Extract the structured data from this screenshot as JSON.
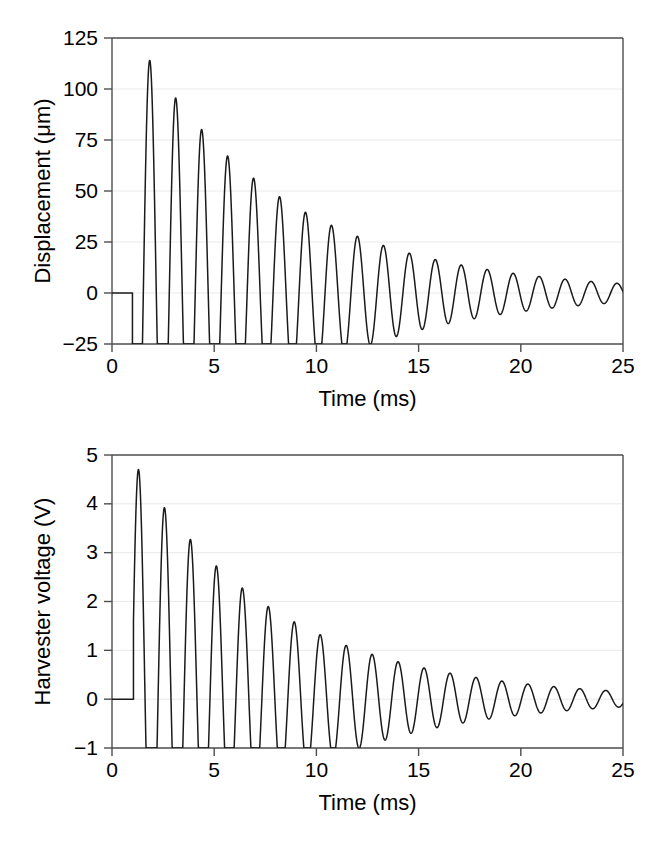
{
  "figure": {
    "background_color": "#ffffff",
    "line_color": "#1a1a1a",
    "axis_color": "#4d4d4d",
    "grid_color": "#e9e9e9"
  },
  "panels": [
    {
      "id": "displacement-panel",
      "ylabel": "Displacement (μm)",
      "xlabel": "Time (ms)",
      "yticks": [
        "125",
        "100",
        "75",
        "50",
        "25",
        "0",
        "−25"
      ],
      "xticks": [
        "0",
        "5",
        "10",
        "15",
        "20",
        "25"
      ]
    },
    {
      "id": "voltage-panel",
      "ylabel": "Harvester voltage (V)",
      "xlabel": "Time (ms)",
      "yticks": [
        "5",
        "4",
        "3",
        "2",
        "1",
        "0",
        "−1"
      ],
      "xticks": [
        "0",
        "5",
        "10",
        "15",
        "20",
        "25"
      ]
    }
  ],
  "chart_data": [
    {
      "type": "line",
      "id": "displacement-vs-time",
      "title": "",
      "xlabel": "Time (ms)",
      "ylabel": "Displacement (μm)",
      "xlim": [
        0,
        25
      ],
      "ylim": [
        -25,
        125
      ],
      "xticks": [
        0,
        5,
        10,
        15,
        20,
        25
      ],
      "yticks": [
        -25,
        0,
        25,
        50,
        75,
        100,
        125
      ],
      "grid": "horizontal",
      "legend": "none",
      "description": "Damped sinusoidal free-vibration ringdown; flat at 0 until excitation at t=1.0 ms, trace clipped at the -25 um axis floor for the first ~10 ms.",
      "quiet_start_ms": 1.0,
      "period_ms": 1.27,
      "decay_time_constant_ms": 7.2,
      "baseline": 0,
      "clip_min": -25,
      "peaks": [
        {
          "t": 1.85,
          "y": 114
        },
        {
          "t": 3.12,
          "y": 91
        },
        {
          "t": 4.39,
          "y": 74
        },
        {
          "t": 5.66,
          "y": 60
        },
        {
          "t": 6.93,
          "y": 49
        },
        {
          "t": 8.2,
          "y": 40
        },
        {
          "t": 9.47,
          "y": 32
        },
        {
          "t": 10.74,
          "y": 27
        },
        {
          "t": 12.01,
          "y": 21
        },
        {
          "t": 13.28,
          "y": 17.5
        },
        {
          "t": 14.55,
          "y": 14.5
        },
        {
          "t": 15.82,
          "y": 12
        },
        {
          "t": 17.09,
          "y": 9.5
        },
        {
          "t": 18.36,
          "y": 8
        },
        {
          "t": 19.63,
          "y": 6.5
        },
        {
          "t": 20.9,
          "y": 5.5
        },
        {
          "t": 22.17,
          "y": 4.5
        },
        {
          "t": 23.44,
          "y": 4
        },
        {
          "t": 24.71,
          "y": 3.5
        }
      ],
      "troughs": [
        {
          "t": 11.4,
          "y": -22
        },
        {
          "t": 12.65,
          "y": -17.5
        },
        {
          "t": 13.9,
          "y": -14
        },
        {
          "t": 15.2,
          "y": -12
        },
        {
          "t": 16.45,
          "y": -9.5
        },
        {
          "t": 17.7,
          "y": -8
        },
        {
          "t": 19.0,
          "y": -6.5
        },
        {
          "t": 20.25,
          "y": -5
        },
        {
          "t": 21.5,
          "y": -4
        },
        {
          "t": 22.8,
          "y": -3.5
        },
        {
          "t": 24.05,
          "y": -3
        }
      ]
    },
    {
      "type": "line",
      "id": "harvester-voltage-vs-time",
      "title": "",
      "xlabel": "Time (ms)",
      "ylabel": "Harvester voltage (V)",
      "xlim": [
        0,
        25
      ],
      "ylim": [
        -1,
        5
      ],
      "xticks": [
        0,
        5,
        10,
        15,
        20,
        25
      ],
      "yticks": [
        -1,
        0,
        1,
        2,
        3,
        4,
        5
      ],
      "grid": "horizontal",
      "legend": "none",
      "description": "Harvester output voltage ringdown; flat at 0 V until t=1.05 ms, trace clipped at the -1 V axis floor for the first ~11 ms.",
      "quiet_start_ms": 1.05,
      "period_ms": 1.27,
      "decay_time_constant_ms": 7.0,
      "baseline": 0,
      "clip_min": -1,
      "peaks": [
        {
          "t": 1.3,
          "y": 4.7
        },
        {
          "t": 2.55,
          "y": 3.8
        },
        {
          "t": 3.82,
          "y": 3.05
        },
        {
          "t": 5.09,
          "y": 2.48
        },
        {
          "t": 6.36,
          "y": 2.02
        },
        {
          "t": 7.63,
          "y": 1.65
        },
        {
          "t": 8.9,
          "y": 1.35
        },
        {
          "t": 10.17,
          "y": 1.08
        },
        {
          "t": 11.44,
          "y": 0.88
        },
        {
          "t": 12.71,
          "y": 0.72
        },
        {
          "t": 13.98,
          "y": 0.6
        },
        {
          "t": 15.25,
          "y": 0.48
        },
        {
          "t": 16.52,
          "y": 0.38
        },
        {
          "t": 17.79,
          "y": 0.32
        },
        {
          "t": 19.06,
          "y": 0.26
        },
        {
          "t": 20.33,
          "y": 0.22
        },
        {
          "t": 21.6,
          "y": 0.18
        },
        {
          "t": 22.87,
          "y": 0.15
        },
        {
          "t": 24.14,
          "y": 0.12
        }
      ],
      "troughs": [
        {
          "t": 11.95,
          "y": -0.75
        },
        {
          "t": 13.3,
          "y": -0.62
        },
        {
          "t": 14.6,
          "y": -0.5
        },
        {
          "t": 15.9,
          "y": -0.4
        },
        {
          "t": 17.15,
          "y": -0.33
        },
        {
          "t": 18.4,
          "y": -0.27
        },
        {
          "t": 19.7,
          "y": -0.22
        },
        {
          "t": 21.0,
          "y": -0.18
        },
        {
          "t": 22.25,
          "y": -0.15
        },
        {
          "t": 23.5,
          "y": -0.12
        },
        {
          "t": 24.8,
          "y": -0.1
        }
      ]
    }
  ]
}
